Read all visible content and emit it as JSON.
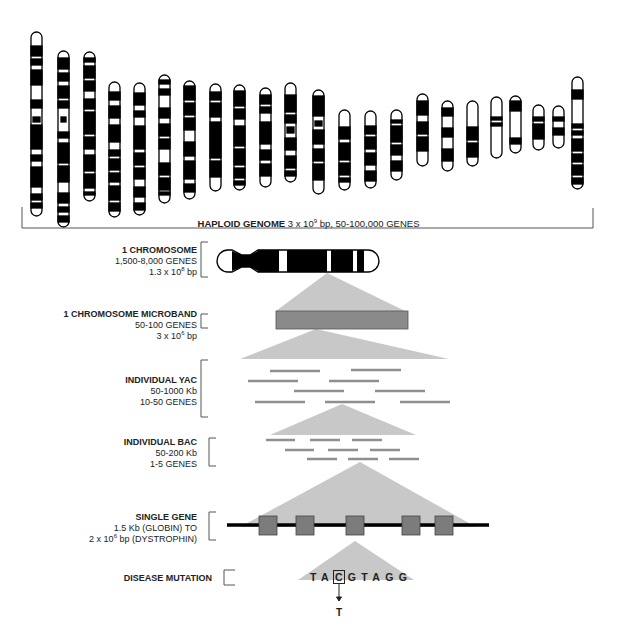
{
  "genome": {
    "label_bold": "HAPLOID GENOME",
    "label_rest_pre": " 3 x 10",
    "label_sup": "9",
    "label_rest_post": " bp, 50-100,000 GENES"
  },
  "levels": [
    {
      "title": "1 CHROMOSOME",
      "line1": "1,500-8,000 GENES",
      "line2_pre": "1.3 x 10",
      "line2_sup": "8",
      "line2_post": " bp"
    },
    {
      "title": "1 CHROMOSOME MICROBAND",
      "line1": "50-100 GENES",
      "line2_pre": "3 x 10",
      "line2_sup": "6",
      "line2_post": " bp"
    },
    {
      "title": "INDIVIDUAL YAC",
      "line1": "50-1000 Kb",
      "line2_pre": "10-50 GENES",
      "line2_sup": "",
      "line2_post": ""
    },
    {
      "title": "INDIVIDUAL BAC",
      "line1": "50-200 Kb",
      "line2_pre": "1-5 GENES",
      "line2_sup": "",
      "line2_post": ""
    },
    {
      "title": "SINGLE GENE",
      "line1": "1.5 Kb (GLOBIN) TO",
      "line2_pre": "2 x 10",
      "line2_sup": "6",
      "line2_post": " bp (DYSTROPHIN)"
    },
    {
      "title": "DISEASE MUTATION",
      "line1": "",
      "line2_pre": "",
      "line2_sup": "",
      "line2_post": ""
    }
  ],
  "mutation": {
    "seq_before": "TA",
    "seq_changed": "C",
    "seq_after": "GTAGG",
    "substitution": "T"
  },
  "colors": {
    "triangle": "#c8c8c8",
    "microband": "#8a8a8a",
    "clone_line": "#8f8f8f",
    "exon": "#7c7c7c",
    "chromatin": "#000000"
  }
}
